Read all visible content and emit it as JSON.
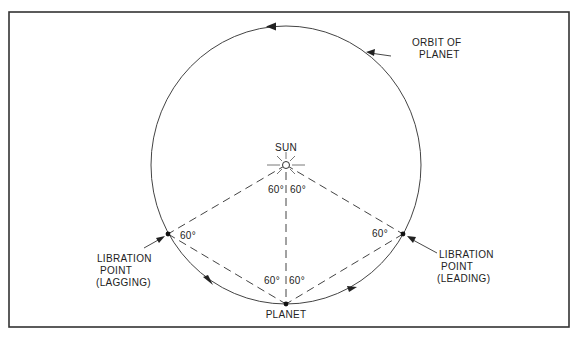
{
  "labels": {
    "sun": "SUN",
    "orbit_line1": "ORBIT OF",
    "orbit_line2": "PLANET",
    "lagging_line1": "LIBRATION",
    "lagging_line2": "POINT",
    "lagging_line3": "(LAGGING)",
    "leading_line1": "LIBRATION",
    "leading_line2": "POINT",
    "leading_line3": "(LEADING)",
    "planet": "PLANET"
  },
  "angles": {
    "sun_left": "60°",
    "sun_right": "60°",
    "lagging": "60°",
    "leading": "60°",
    "planet_left": "60°",
    "planet_right": "60°"
  },
  "colors": {
    "line": "#333333",
    "frame": "#333333",
    "background": "#ffffff"
  }
}
